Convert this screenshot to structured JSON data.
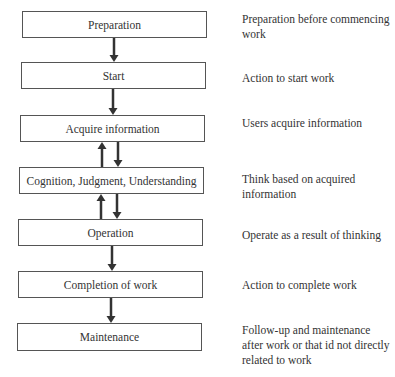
{
  "diagram": {
    "steps": [
      {
        "label": "Preparation",
        "description": "Preparation before commencing work"
      },
      {
        "label": "Start",
        "description": "Action to start work"
      },
      {
        "label": "Acquire information",
        "description": "Users acquire information"
      },
      {
        "label": "Cognition, Judgment, Understanding",
        "description": "Think based on acquired information"
      },
      {
        "label": "Operation",
        "description": "Operate as a result of thinking"
      },
      {
        "label": "Completion of work",
        "description": "Action to complete work"
      },
      {
        "label": "Maintenance",
        "description": "Follow-up and maintenance after work or that id not directly related to work"
      }
    ],
    "connections": [
      {
        "from": "Preparation",
        "to": "Start",
        "direction": "down"
      },
      {
        "from": "Start",
        "to": "Acquire information",
        "direction": "down"
      },
      {
        "from": "Acquire information",
        "to": "Cognition, Judgment, Understanding",
        "direction": "bidirectional"
      },
      {
        "from": "Cognition, Judgment, Understanding",
        "to": "Operation",
        "direction": "bidirectional"
      },
      {
        "from": "Operation",
        "to": "Completion of work",
        "direction": "down"
      },
      {
        "from": "Completion of work",
        "to": "Maintenance",
        "direction": "down"
      }
    ]
  }
}
